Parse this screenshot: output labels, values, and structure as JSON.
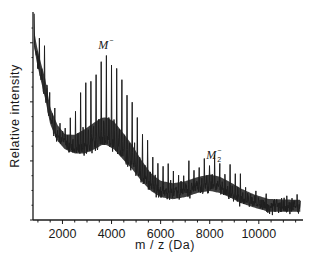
{
  "chart_data": {
    "type": "line",
    "title": "",
    "xlabel": "m / z (Da)",
    "ylabel": "Relative intensity",
    "xlim": [
      800,
      11800
    ],
    "ylim": [
      0,
      100
    ],
    "xticks": [
      2000,
      4000,
      6000,
      8000,
      10000
    ],
    "xtick_labels": [
      "2000",
      "4000",
      "6000",
      "8000",
      "10000"
    ],
    "xminor_step": 500,
    "yticks_major": [
      0,
      28.5,
      57,
      85
    ],
    "yminor_step": 7.1,
    "grid": false,
    "legend": "none",
    "peak_spacing_da": 210,
    "series": [
      {
        "name": "upper envelope (peak tops)",
        "x": [
          850,
          950,
          1100,
          1300,
          1500,
          1800,
          2100,
          2500,
          2900,
          3300,
          3600,
          3800,
          4100,
          4400,
          4800,
          5200,
          5600,
          6000,
          6500,
          7000,
          7500,
          8000,
          8400,
          8800,
          9300,
          9800,
          10400,
          11000,
          11700
        ],
        "y": [
          99,
          92,
          86,
          82,
          62,
          52,
          46,
          52,
          64,
          72,
          75,
          76,
          74,
          68,
          58,
          44,
          32,
          26,
          24,
          25,
          27,
          29,
          28,
          24,
          19,
          14,
          11,
          10,
          9
        ]
      },
      {
        "name": "lower envelope (baseline)",
        "x": [
          850,
          950,
          1100,
          1300,
          1500,
          1800,
          2100,
          2500,
          2900,
          3300,
          3600,
          3800,
          4100,
          4400,
          4800,
          5200,
          5600,
          6000,
          6500,
          7000,
          7500,
          8000,
          8400,
          8800,
          9300,
          9800,
          10400,
          11000,
          11700
        ],
        "y": [
          85,
          78,
          70,
          60,
          48,
          40,
          36,
          34,
          34,
          36,
          38,
          38,
          36,
          32,
          27,
          21,
          16,
          13,
          12,
          13,
          15,
          16,
          15,
          13,
          10,
          8,
          6,
          6,
          6
        ]
      }
    ],
    "annotations": [
      {
        "text": "M",
        "sup": "−",
        "sub": "",
        "x": 3700,
        "y": 82
      },
      {
        "text": "M",
        "sup": "−",
        "sub": "2",
        "x": 8100,
        "y": 29.5
      }
    ]
  }
}
